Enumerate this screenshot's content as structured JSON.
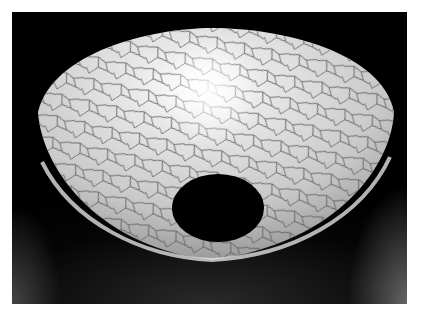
{
  "image": {
    "subject": "crackle-glazed ceramic bowl",
    "background_color": "#000000",
    "frame_color": "#ffffff",
    "glaze_color": "#d9d9d9",
    "crackle_color": "#555555",
    "highlight_color": "#ffffff",
    "foot_hole_color": "#000000"
  }
}
